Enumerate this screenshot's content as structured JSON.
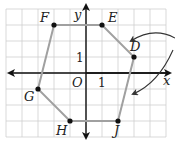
{
  "figure": {
    "type": "coordinate-grid-hexagon",
    "grid": {
      "x_min": -5,
      "x_max": 5,
      "y_min": -4,
      "y_max": 4,
      "unit_px": 16,
      "origin_px": [
        86,
        73
      ]
    },
    "axes": {
      "x_label": "x",
      "y_label": "y",
      "origin_label": "O",
      "x_tick_label": "1",
      "y_tick_label": "1"
    },
    "vertices": [
      {
        "name": "F",
        "x": -2,
        "y": 3
      },
      {
        "name": "E",
        "x": 1,
        "y": 3
      },
      {
        "name": "D",
        "x": 3,
        "y": 1
      },
      {
        "name": "J",
        "x": 2,
        "y": -3
      },
      {
        "name": "H",
        "x": -1,
        "y": -3
      },
      {
        "name": "G",
        "x": -3,
        "y": -1
      }
    ],
    "colors": {
      "grid": "#c8c8c8",
      "polygon": "#a0a0a0",
      "axis": "#111111",
      "point": "#111111",
      "arrow": "#333333"
    },
    "annotations": [
      "curved arrow pointing to segment ED",
      "curved arrow pointing to segment DJ"
    ]
  }
}
